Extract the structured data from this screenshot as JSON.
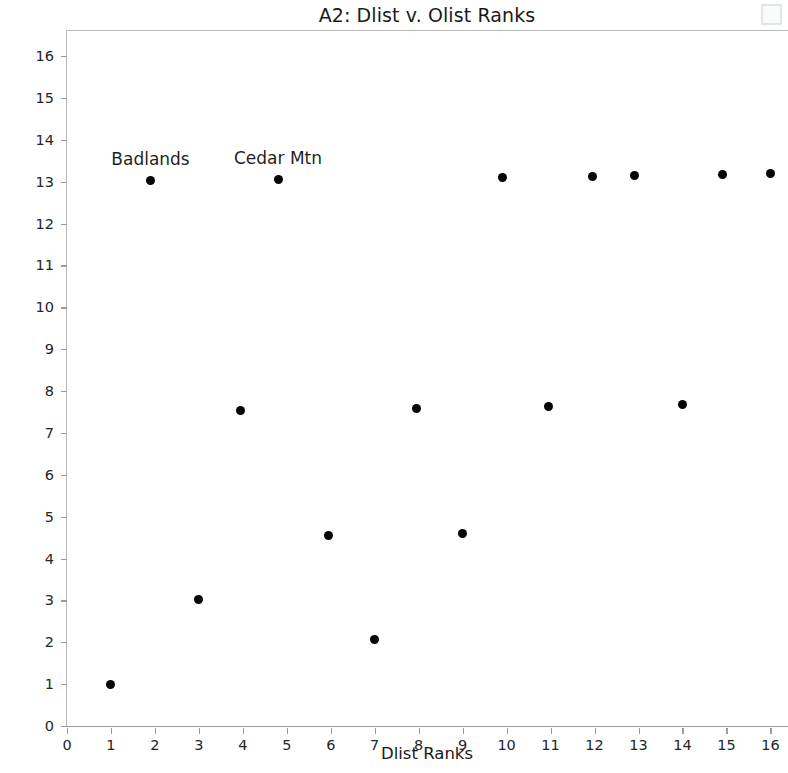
{
  "chart_data": {
    "type": "scatter",
    "title": "A2: Dlist v. Olist Ranks",
    "xlabel": "Dlist Ranks",
    "ylabel": "Olist Ranks",
    "xlim": [
      0,
      16.4
    ],
    "ylim": [
      0,
      16.6
    ],
    "grid": false,
    "legend": "none",
    "xticks": [
      0,
      1,
      2,
      3,
      4,
      5,
      6,
      7,
      8,
      9,
      10,
      11,
      12,
      13,
      14,
      15,
      16
    ],
    "yticks": [
      0,
      1,
      2,
      3,
      4,
      5,
      6,
      7,
      8,
      9,
      10,
      11,
      12,
      13,
      14,
      15,
      16
    ],
    "marker": "circle",
    "marker_color": "#050505",
    "marker_size": 9,
    "points": [
      {
        "x": 1.0,
        "y": 0.98,
        "label": ""
      },
      {
        "x": 1.9,
        "y": 13.02,
        "label": "Badlands"
      },
      {
        "x": 3.0,
        "y": 3.03,
        "label": ""
      },
      {
        "x": 3.95,
        "y": 7.54,
        "label": ""
      },
      {
        "x": 4.8,
        "y": 13.05,
        "label": "Cedar Mtn"
      },
      {
        "x": 5.95,
        "y": 4.56,
        "label": ""
      },
      {
        "x": 7.0,
        "y": 2.06,
        "label": ""
      },
      {
        "x": 7.95,
        "y": 7.59,
        "label": ""
      },
      {
        "x": 9.0,
        "y": 4.6,
        "label": ""
      },
      {
        "x": 9.9,
        "y": 13.1,
        "label": ""
      },
      {
        "x": 10.95,
        "y": 7.63,
        "label": ""
      },
      {
        "x": 11.95,
        "y": 13.13,
        "label": ""
      },
      {
        "x": 12.9,
        "y": 13.14,
        "label": ""
      },
      {
        "x": 14.0,
        "y": 7.68,
        "label": ""
      },
      {
        "x": 14.9,
        "y": 13.17,
        "label": ""
      },
      {
        "x": 16.0,
        "y": 13.19,
        "label": ""
      }
    ],
    "annotations": [
      {
        "text": "Badlands",
        "x": 1.9,
        "y": 13.02
      },
      {
        "text": "Cedar Mtn",
        "x": 4.8,
        "y": 13.05
      }
    ]
  },
  "figure": {
    "background_color": "#ffffff",
    "axis_color": "#9a9a9a",
    "text_color": "#1a1a1a"
  }
}
